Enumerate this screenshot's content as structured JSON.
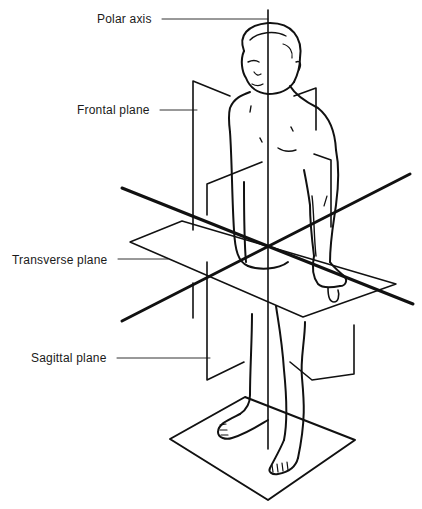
{
  "diagram": {
    "labels": [
      {
        "id": "polar-axis",
        "text": "Polar axis",
        "x": 97,
        "y": 12
      },
      {
        "id": "frontal-plane",
        "text": "Frontal plane",
        "x": 77,
        "y": 103
      },
      {
        "id": "transverse-plane",
        "text": "Transverse plane",
        "x": 12,
        "y": 253
      },
      {
        "id": "sagittal-plane",
        "text": "Sagittal plane",
        "x": 31,
        "y": 351
      }
    ],
    "colors": {
      "ink": "#111111",
      "leader": "#333333",
      "background": "#ffffff"
    }
  }
}
